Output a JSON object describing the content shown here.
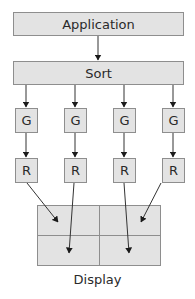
{
  "diagram": {
    "top": {
      "label": "Application"
    },
    "sort": {
      "label": "Sort"
    },
    "geometry_units": [
      {
        "label": "G"
      },
      {
        "label": "G"
      },
      {
        "label": "G"
      },
      {
        "label": "G"
      }
    ],
    "raster_units": [
      {
        "label": "R"
      },
      {
        "label": "R"
      },
      {
        "label": "R"
      },
      {
        "label": "R"
      }
    ],
    "display": {
      "label": "Display",
      "grid": {
        "rows": 2,
        "cols": 2
      }
    },
    "edges": [
      {
        "from": "Application",
        "to": "Sort"
      },
      {
        "from": "Sort",
        "to": "G1"
      },
      {
        "from": "Sort",
        "to": "G2"
      },
      {
        "from": "Sort",
        "to": "G3"
      },
      {
        "from": "Sort",
        "to": "G4"
      },
      {
        "from": "G1",
        "to": "R1"
      },
      {
        "from": "G2",
        "to": "R2"
      },
      {
        "from": "G3",
        "to": "R3"
      },
      {
        "from": "G4",
        "to": "R4"
      },
      {
        "from": "R1",
        "to": "Display top-left"
      },
      {
        "from": "R2",
        "to": "Display bottom-left"
      },
      {
        "from": "R3",
        "to": "Display bottom-right"
      },
      {
        "from": "R4",
        "to": "Display top-right"
      }
    ],
    "colors": {
      "box_fill": "#e3e3e3",
      "box_border": "#8e8e8e",
      "arrow": "#1a1a1a"
    }
  }
}
